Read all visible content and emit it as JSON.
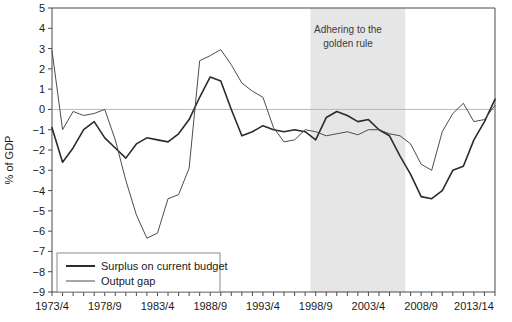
{
  "chart_data": {
    "type": "line",
    "title": "",
    "subtitle": "",
    "xlabel": "",
    "ylabel": "% of GDP",
    "ylim": [
      -9,
      5
    ],
    "xlim": [
      1973,
      2015
    ],
    "grid": false,
    "zero_line": true,
    "legend_position": "bottom-left",
    "y_ticks": [
      5,
      4,
      3,
      2,
      1,
      0,
      -1,
      -2,
      -3,
      -4,
      -5,
      -6,
      -7,
      -8,
      -9
    ],
    "y_tick_labels": [
      "5",
      "4",
      "3",
      "2",
      "1",
      "0",
      "−1",
      "−2",
      "−3",
      "−4",
      "−5",
      "−6",
      "−7",
      "−8",
      "−9"
    ],
    "x_tick_labels": [
      "1973/4",
      "1978/9",
      "1983/4",
      "1988/9",
      "1993/4",
      "1998/9",
      "2003/4",
      "2008/9",
      "2013/14"
    ],
    "x_tick_values": [
      1973,
      1978,
      1983,
      1988,
      1993,
      1998,
      2003,
      2008,
      2013
    ],
    "x_minor_tick_values": [
      1973,
      1974,
      1975,
      1976,
      1977,
      1978,
      1979,
      1980,
      1981,
      1982,
      1983,
      1984,
      1985,
      1986,
      1987,
      1988,
      1989,
      1990,
      1991,
      1992,
      1993,
      1994,
      1995,
      1996,
      1997,
      1998,
      1999,
      2000,
      2001,
      2002,
      2003,
      2004,
      2005,
      2006,
      2007,
      2008,
      2009,
      2010,
      2011,
      2012,
      2013,
      2014,
      2015
    ],
    "x": [
      1973,
      1974,
      1975,
      1976,
      1977,
      1978,
      1979,
      1980,
      1981,
      1982,
      1983,
      1984,
      1985,
      1986,
      1987,
      1988,
      1989,
      1990,
      1991,
      1992,
      1993,
      1994,
      1995,
      1996,
      1997,
      1998,
      1999,
      2000,
      2001,
      2002,
      2003,
      2004,
      2005,
      2006,
      2007,
      2008,
      2009,
      2010,
      2011,
      2012,
      2013,
      2014,
      2015
    ],
    "series": [
      {
        "name": "Surplus on current budget",
        "color": "#2b2b2b",
        "width": 1.6,
        "values": [
          -0.9,
          -2.6,
          -1.9,
          -1.0,
          -0.6,
          -1.4,
          -1.9,
          -2.4,
          -1.7,
          -1.4,
          -1.5,
          -1.6,
          -1.2,
          -0.5,
          0.6,
          1.6,
          1.4,
          0.0,
          -1.3,
          -1.1,
          -0.8,
          -1.0,
          -1.1,
          -1.0,
          -1.1,
          -1.5,
          -0.4,
          -0.1,
          -0.3,
          -0.6,
          -0.5,
          -1.0,
          -1.3,
          -2.3,
          -3.2,
          -4.3,
          -4.4,
          -4.0,
          -3.0,
          -2.8,
          -1.5,
          -0.6,
          0.5
        ]
      },
      {
        "name": "Output gap",
        "color": "#4d4d4d",
        "width": 1.0,
        "values": [
          2.9,
          -1.0,
          -0.1,
          -0.3,
          -0.2,
          0.0,
          -1.5,
          -3.5,
          -5.2,
          -6.35,
          -6.1,
          -4.4,
          -4.2,
          -2.9,
          2.4,
          2.65,
          2.95,
          2.2,
          1.3,
          0.9,
          0.6,
          -0.9,
          -1.6,
          -1.5,
          -1.0,
          -1.1,
          -1.3,
          -1.2,
          -1.1,
          -1.25,
          -1.0,
          -1.0,
          -1.2,
          -1.3,
          -1.7,
          -2.7,
          -3.0,
          -1.1,
          -0.2,
          0.3,
          -0.6,
          -0.5,
          0.2
        ]
      }
    ],
    "annotations": [
      {
        "name": "golden-rule-band",
        "lines": [
          "Adhering to the",
          "golden rule"
        ],
        "x_start": 1997.5,
        "x_end": 2006.5,
        "fill": "#e6e6e6"
      }
    ]
  },
  "chart": {
    "y_axis_title": "% of GDP",
    "annotation_line1": "Adhering to the",
    "annotation_line2": "golden rule",
    "legend": {
      "item1": "Surplus on current budget",
      "item2": "Output gap"
    }
  }
}
